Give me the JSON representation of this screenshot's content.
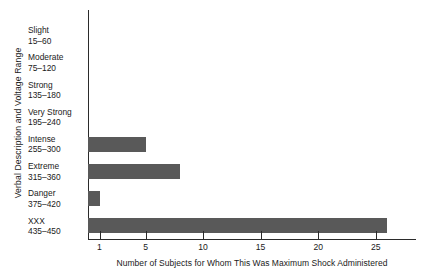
{
  "chart_data": {
    "type": "bar",
    "orientation": "horizontal",
    "title": "",
    "xlabel": "Number of Subjects for Whom This Was Maximum Shock Administered",
    "ylabel": "Verbal Description and Voltage Range",
    "categories": [
      "Slight",
      "Moderate",
      "Strong",
      "Very Strong",
      "Intense",
      "Extreme",
      "Danger",
      "XXX"
    ],
    "category_ranges": [
      "15–60",
      "75–120",
      "135–180",
      "195–240",
      "255–300",
      "315–360",
      "375–420",
      "435–450"
    ],
    "values": [
      0,
      0,
      0,
      0,
      5,
      8,
      1,
      26
    ],
    "xlim": [
      0,
      28.5
    ],
    "xticks": [
      1,
      5,
      10,
      15,
      20,
      25
    ],
    "xticklabels": [
      "1",
      "5",
      "10",
      "15",
      "20",
      "25"
    ],
    "grid": false,
    "legend": false,
    "bar_color": "#595959",
    "axis_color": "#2b2b2b",
    "background_color": "#ffffff"
  }
}
